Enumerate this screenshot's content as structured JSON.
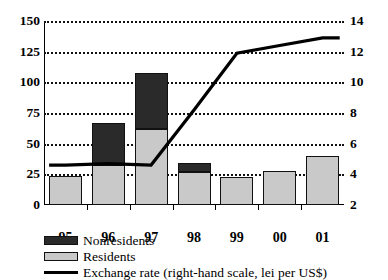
{
  "chart_data": {
    "type": "bar",
    "title": "",
    "subtitle": "",
    "xlabel": "",
    "ylabel": "",
    "y2label": "",
    "categories": [
      "95",
      "96",
      "97",
      "98",
      "99",
      "00",
      "01"
    ],
    "ylim": [
      0,
      150
    ],
    "yticks": [
      0,
      25,
      50,
      75,
      100,
      125,
      150
    ],
    "y2lim": [
      2,
      14
    ],
    "y2ticks": [
      2,
      4,
      6,
      8,
      10,
      12,
      14
    ],
    "grid": true,
    "legend_position": "below",
    "stacked": true,
    "series": [
      {
        "name": "Residents",
        "type": "bar",
        "axis": "left",
        "color": "#c9c9c9",
        "values": [
          24,
          33,
          62,
          27,
          23,
          28,
          40
        ]
      },
      {
        "name": "Nonresidents",
        "type": "bar",
        "axis": "left",
        "color": "#2a2a2a",
        "values": [
          0,
          34,
          46,
          7,
          0,
          0,
          0
        ]
      },
      {
        "name": "Exchange rate (right-hand scale, lei per US$)",
        "type": "line",
        "axis": "right",
        "color": "#000000",
        "values": [
          4.6,
          4.7,
          4.6,
          8.2,
          11.9,
          12.4,
          12.9
        ]
      }
    ],
    "totals": [
      24,
      67,
      108,
      34,
      23,
      28,
      40
    ]
  },
  "axes": {
    "left_ticks": [
      "150",
      "125",
      "100",
      "75",
      "50",
      "25",
      "0"
    ],
    "right_ticks": [
      "14",
      "12",
      "10",
      "8",
      "6",
      "4",
      "2"
    ],
    "x_ticks": [
      "95",
      "96",
      "97",
      "98",
      "99",
      "00",
      "01"
    ]
  },
  "legend": {
    "items": [
      {
        "label": "Nonresidents",
        "marker": "dark-square-swatch"
      },
      {
        "label": "Residents",
        "marker": "light-square-swatch"
      },
      {
        "label": "Exchange rate (right-hand scale, lei per US$)",
        "marker": "solid-line-swatch"
      }
    ]
  }
}
